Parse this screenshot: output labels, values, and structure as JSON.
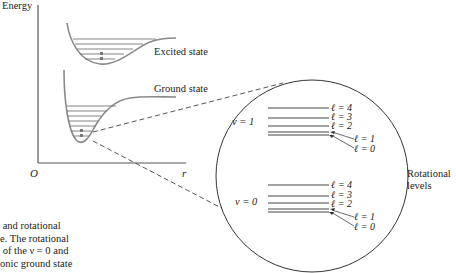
{
  "axes": {
    "y_label": "Energy",
    "origin_label": "O",
    "x_label": "r"
  },
  "curves": {
    "excited_label": "Excited state",
    "ground_label": "Ground state",
    "curve_color": "#8a8a8a"
  },
  "inset": {
    "title_line1": "Rotational",
    "title_line2": "levels",
    "v1_label": "ν = 1",
    "v0_label": "ν = 0",
    "v1_levels": [
      "ℓ = 4",
      "ℓ = 3",
      "ℓ = 2",
      "ℓ = 1",
      "ℓ = 0"
    ],
    "v0_levels": [
      "ℓ = 4",
      "ℓ = 3",
      "ℓ = 2",
      "ℓ = 1",
      "ℓ = 0"
    ]
  },
  "caption": {
    "lines": [
      " and rotational",
      "e. The rotational",
      " of the ν = 0 and",
      "onic ground state"
    ]
  }
}
